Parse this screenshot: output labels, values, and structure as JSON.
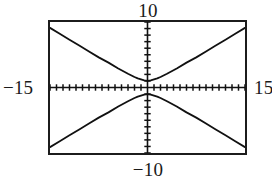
{
  "graph": {
    "window_labels": {
      "xmin": "−15",
      "xmax": "15",
      "ymax": "10",
      "ymin": "−10"
    },
    "frame_color": "#1c1c1c",
    "curve_color": "#111111",
    "background_color": "#ffffff"
  },
  "chart_data": {
    "type": "line",
    "title": "",
    "subtitle": "",
    "xlabel": "",
    "ylabel": "",
    "xlim": [
      -15,
      15
    ],
    "ylim": [
      -10,
      10
    ],
    "xtick_step": 1,
    "ytick_step": 1,
    "grid": false,
    "legend": "none",
    "axes": {
      "x_axis_visible": true,
      "y_axis_visible": true,
      "tick_marks": true,
      "tick_labels_shown": false
    },
    "annotations": [
      {
        "text": "10",
        "position": "top-center",
        "meaning": "y maximum of viewing window"
      },
      {
        "text": "−10",
        "position": "bottom-center",
        "meaning": "y minimum of viewing window"
      },
      {
        "text": "−15",
        "position": "left-middle",
        "meaning": "x minimum of viewing window"
      },
      {
        "text": "15",
        "position": "right-middle",
        "meaning": "x maximum of viewing window"
      }
    ],
    "series": [
      {
        "name": "upper branch",
        "description": "hyperbola branch opening upward, vertex near (0, 1)",
        "x": [
          -15,
          -13.5,
          -12,
          -10.5,
          -9,
          -7.5,
          -6,
          -4.5,
          -3,
          -2,
          -1.5,
          -1,
          -0.5,
          0,
          0.5,
          1,
          1.5,
          2,
          3,
          4.5,
          6,
          7.5,
          9,
          10.5,
          12,
          13.5,
          15
        ],
        "y": [
          9.1,
          8.2,
          7.3,
          6.4,
          5.5,
          4.6,
          3.8,
          2.9,
          2.1,
          1.6,
          1.4,
          1.25,
          1.1,
          1.0,
          1.1,
          1.25,
          1.4,
          1.6,
          2.1,
          2.9,
          3.8,
          4.6,
          5.5,
          6.4,
          7.3,
          8.2,
          9.1
        ]
      },
      {
        "name": "lower branch",
        "description": "hyperbola branch opening downward, vertex near (0, -1)",
        "x": [
          -15,
          -13.5,
          -12,
          -10.5,
          -9,
          -7.5,
          -6,
          -4.5,
          -3,
          -2,
          -1.5,
          -1,
          -0.5,
          0,
          0.5,
          1,
          1.5,
          2,
          3,
          4.5,
          6,
          7.5,
          9,
          10.5,
          12,
          13.5,
          15
        ],
        "y": [
          -9.1,
          -8.2,
          -7.3,
          -6.4,
          -5.5,
          -4.6,
          -3.8,
          -2.9,
          -2.1,
          -1.6,
          -1.4,
          -1.25,
          -1.1,
          -1.0,
          -1.1,
          -1.25,
          -1.4,
          -1.6,
          -2.1,
          -2.9,
          -3.8,
          -4.6,
          -5.5,
          -6.4,
          -7.3,
          -8.2,
          -9.1
        ]
      }
    ]
  }
}
